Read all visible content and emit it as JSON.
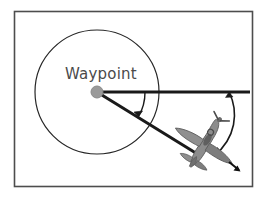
{
  "figure": {
    "title_label": "Waypoint",
    "background_color": "#ffffff",
    "frame": {
      "stroke_color": "#4d4d4d",
      "x": 14,
      "y": 11,
      "width": 239,
      "height": 176
    },
    "waypoint": {
      "label": "Waypoint",
      "label_x": 65,
      "label_y": 78,
      "marker_color": "#9a9a9a",
      "marker_edge_color": "#8a8a8a",
      "center_x": 97,
      "center_y": 92,
      "marker_radius": 6
    },
    "acceptance_circle": {
      "name": "waypoint-acceptance-radius",
      "center_x": 97,
      "center_y": 92,
      "radius": 62,
      "stroke_color": "#262626",
      "stroke_width": 1.2
    },
    "reference_line": {
      "name": "horizontal-reference-line",
      "x1": 97,
      "y1": 92,
      "x2": 250,
      "y2": 92,
      "stroke_color": "#1a1a1a",
      "stroke_width": 3
    },
    "bearing_line": {
      "name": "waypoint-to-aircraft-bearing",
      "x1": 97,
      "y1": 92,
      "x2": 199,
      "y2": 155,
      "stroke_color": "#1a1a1a",
      "stroke_width": 3
    },
    "bearing_angle_arc": {
      "name": "bearing-angle-arc",
      "center_x": 97,
      "center_y": 92,
      "radius": 48,
      "stroke_color": "#1a1a1a",
      "stroke_width": 1.4
    },
    "heading_angle_arc": {
      "name": "heading-angle-arc",
      "stroke_color": "#1a1a1a",
      "stroke_width": 1.6
    },
    "aircraft": {
      "name": "aircraft-spitfire",
      "body_color": "#8c8c8c",
      "shade_color": "#6f6f6f",
      "outline_color": "#5a5a5a",
      "center_x": 205,
      "center_y": 143,
      "heading_deg": 32
    },
    "velocity_arrow": {
      "name": "velocity-vector-arrow",
      "stroke_color": "#111111"
    }
  }
}
